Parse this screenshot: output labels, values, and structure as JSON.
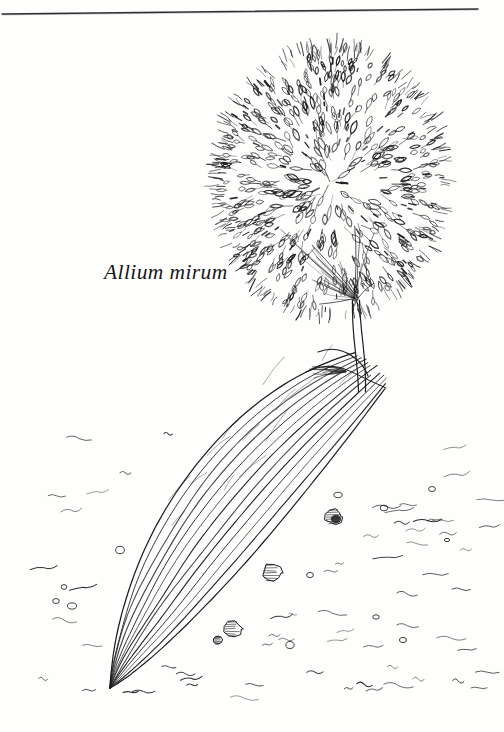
{
  "page": {
    "background_color": "#fefefd",
    "ink_color": "#1d1d20",
    "width": 504,
    "height": 732
  },
  "rule": {
    "name": "top-horizontal-rule",
    "color": "#303032",
    "x1": 2,
    "y1": 14,
    "x2": 478,
    "y2": 9
  },
  "caption": {
    "species_name": "Allium mirum"
  },
  "illustration": {
    "subject": "Allium mirum",
    "medium": "pen-and-ink line drawing",
    "umbel": {
      "center_x": 331,
      "center_y": 181,
      "radius_x": 109,
      "radius_y": 128,
      "floret_count": 430,
      "description": "dense globose umbel of narrow teardrop florets radiating outward"
    },
    "stem": {
      "top_x": 356,
      "top_y": 300,
      "bottom_x": 362,
      "bottom_y": 392,
      "width": 7
    },
    "leaf": {
      "tip_x": 110,
      "tip_y": 688,
      "base_x": 368,
      "base_y": 372,
      "vein_count": 12,
      "description": "long strap-shaped basal leaf with wavy parallel veins converging to a point"
    },
    "ground": {
      "pebble_count": 9,
      "dash_count": 64,
      "description": "stippled soil with scattered pebbles and short wavy dashes"
    }
  }
}
